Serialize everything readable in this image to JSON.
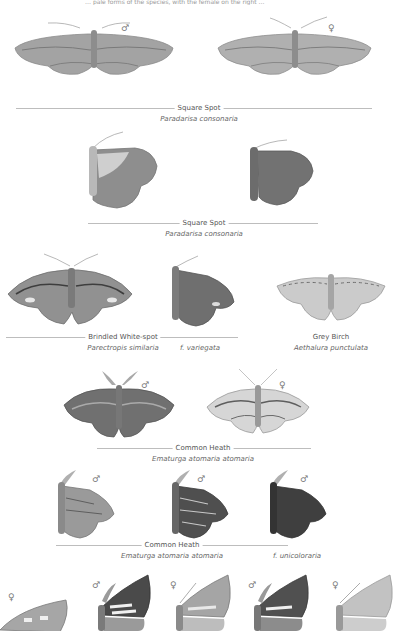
{
  "page_header_fragment": "… pale forms of the species, with the female on the right …",
  "sex_symbols": {
    "male": "♂",
    "female": "♀"
  },
  "plates": [
    {
      "id": "square-spot-set",
      "common_name": "Square Spot",
      "scientific_name": "Paradarisa consonaria",
      "figures": [
        {
          "pose": "spread",
          "sex": "♂",
          "tone": "#9a9a9a"
        },
        {
          "pose": "spread",
          "sex": "♀",
          "tone": "#a8a8a8"
        }
      ]
    },
    {
      "id": "square-spot-resting",
      "common_name": "Square Spot",
      "scientific_name": "Paradarisa consonaria",
      "figures": [
        {
          "pose": "resting",
          "tone": "#8d8d8d"
        },
        {
          "pose": "resting",
          "tone": "#6f6f6f"
        }
      ]
    },
    {
      "id": "brindled-white-spot",
      "common_name": "Brindled White-spot",
      "scientific_name": "Parectropis similaria",
      "form_label": "f. variegata",
      "figures": [
        {
          "pose": "spread",
          "tone": "#8a8a8a"
        },
        {
          "pose": "resting",
          "tone": "#6e6e6e"
        }
      ]
    },
    {
      "id": "grey-birch",
      "common_name": "Grey Birch",
      "scientific_name": "Aethalura punctulata",
      "figures": [
        {
          "pose": "spread",
          "tone": "#c4c4c4"
        }
      ]
    },
    {
      "id": "common-heath-set",
      "common_name": "Common Heath",
      "scientific_name": "Ematurga atomaria atomaria",
      "figures": [
        {
          "pose": "spread",
          "sex": "♂",
          "tone": "#6f6f6f"
        },
        {
          "pose": "spread",
          "sex": "♀",
          "tone": "#bcbcbc"
        }
      ]
    },
    {
      "id": "common-heath-resting",
      "common_name": "Common Heath",
      "scientific_name": "Ematurga atomaria atomaria",
      "form_label": "f. unicoloraria",
      "figures": [
        {
          "pose": "resting",
          "sex": "♂",
          "tone": "#8f8f8f"
        },
        {
          "pose": "resting",
          "sex": "♂",
          "tone": "#4e4e4e"
        },
        {
          "pose": "resting",
          "sex": "♂",
          "tone": "#3e3e3e"
        }
      ]
    },
    {
      "id": "bottom-row-partial",
      "figures": [
        {
          "pose": "spread-partial",
          "sex": "♀",
          "tone": "#a0a0a0"
        },
        {
          "pose": "resting",
          "sex": "♂",
          "tone": "#4a4a4a"
        },
        {
          "pose": "resting",
          "sex": "♀",
          "tone": "#9a9a9a"
        },
        {
          "pose": "resting",
          "sex": "♂",
          "tone": "#555555"
        },
        {
          "pose": "resting",
          "sex": "♀",
          "tone": "#b4b4b4"
        }
      ]
    }
  ]
}
